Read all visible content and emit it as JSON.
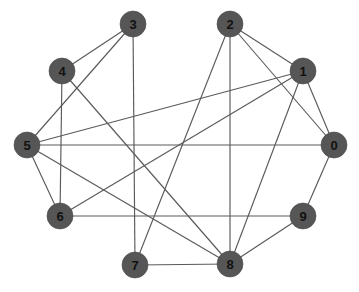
{
  "figure": {
    "title": "",
    "background_color": "#ffffff",
    "width": 359,
    "height": 292
  },
  "style": {
    "node_fill": "#565656",
    "node_stroke": "#4a4a4a",
    "node_radius": 13,
    "node_label_color": "#111111",
    "edge_color": "#5a5a5a",
    "edge_width": 1.15
  },
  "graph": {
    "type": "undirected-node-link-diagram",
    "node_count": 10,
    "edge_count": 20,
    "nodes": [
      {
        "id": "0",
        "label": "0",
        "x": 334,
        "y": 145,
        "degree": 4
      },
      {
        "id": "1",
        "label": "1",
        "x": 303,
        "y": 71,
        "degree": 5
      },
      {
        "id": "2",
        "label": "2",
        "x": 230,
        "y": 24,
        "degree": 4
      },
      {
        "id": "3",
        "label": "3",
        "x": 133,
        "y": 24,
        "degree": 3
      },
      {
        "id": "4",
        "label": "4",
        "x": 62,
        "y": 71,
        "degree": 3
      },
      {
        "id": "5",
        "label": "5",
        "x": 27,
        "y": 145,
        "degree": 5
      },
      {
        "id": "6",
        "label": "6",
        "x": 60,
        "y": 216,
        "degree": 4
      },
      {
        "id": "7",
        "label": "7",
        "x": 135,
        "y": 265,
        "degree": 3
      },
      {
        "id": "8",
        "label": "8",
        "x": 230,
        "y": 264,
        "degree": 7
      },
      {
        "id": "9",
        "label": "9",
        "x": 303,
        "y": 216,
        "degree": 3
      }
    ],
    "edges": [
      {
        "source": "3",
        "target": "4"
      },
      {
        "source": "3",
        "target": "5"
      },
      {
        "source": "3",
        "target": "7"
      },
      {
        "source": "4",
        "target": "6"
      },
      {
        "source": "4",
        "target": "8"
      },
      {
        "source": "5",
        "target": "0"
      },
      {
        "source": "5",
        "target": "1"
      },
      {
        "source": "5",
        "target": "6"
      },
      {
        "source": "5",
        "target": "8"
      },
      {
        "source": "6",
        "target": "1"
      },
      {
        "source": "6",
        "target": "9"
      },
      {
        "source": "2",
        "target": "7"
      },
      {
        "source": "2",
        "target": "8"
      },
      {
        "source": "2",
        "target": "1"
      },
      {
        "source": "2",
        "target": "0"
      },
      {
        "source": "1",
        "target": "0"
      },
      {
        "source": "1",
        "target": "8"
      },
      {
        "source": "0",
        "target": "9"
      },
      {
        "source": "9",
        "target": "8"
      },
      {
        "source": "7",
        "target": "8"
      }
    ]
  }
}
